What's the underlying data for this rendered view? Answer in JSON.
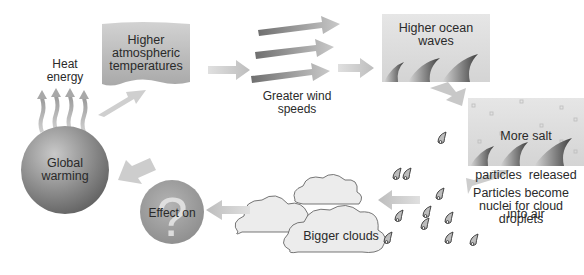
{
  "diagram": {
    "type": "feedback-loop",
    "nodes": [
      {
        "id": "global_warming",
        "label": "Global warming",
        "lines": [
          "Global",
          "warming"
        ]
      },
      {
        "id": "heat_energy",
        "label": "Heat energy",
        "lines": [
          "Heat",
          "energy"
        ]
      },
      {
        "id": "higher_temps",
        "label": "Higher atmospheric temperatures",
        "lines": [
          "Higher",
          "atmospheric",
          "temperatures"
        ]
      },
      {
        "id": "wind",
        "label": "Greater wind speeds",
        "lines": [
          "Greater wind",
          "speeds"
        ]
      },
      {
        "id": "waves",
        "label": "Higher ocean waves",
        "lines": [
          "Higher ocean",
          "waves"
        ]
      },
      {
        "id": "salt",
        "label": "More salt particles released into air",
        "lines": [
          "More salt",
          "particles  released",
          "into air"
        ]
      },
      {
        "id": "nuclei",
        "label": "Particles become nuclei for cloud droplets",
        "lines": [
          "Particles become",
          "nuclei for cloud",
          "droplets"
        ]
      },
      {
        "id": "clouds",
        "label": "Bigger clouds"
      },
      {
        "id": "effect",
        "label": "Effect on",
        "symbol": "?"
      }
    ],
    "edges": [
      [
        "global_warming",
        "higher_temps"
      ],
      [
        "higher_temps",
        "wind"
      ],
      [
        "wind",
        "waves"
      ],
      [
        "waves",
        "salt"
      ],
      [
        "salt",
        "nuclei"
      ],
      [
        "nuclei",
        "clouds"
      ],
      [
        "clouds",
        "effect"
      ],
      [
        "effect",
        "global_warming"
      ]
    ]
  },
  "colors": {
    "sphere": "#8c8c8c",
    "panel": "#d6d6d6",
    "arrow": "#c4c4c4",
    "dark_arrow": "#7a7a7a",
    "droplet": "#b5b5b5"
  }
}
